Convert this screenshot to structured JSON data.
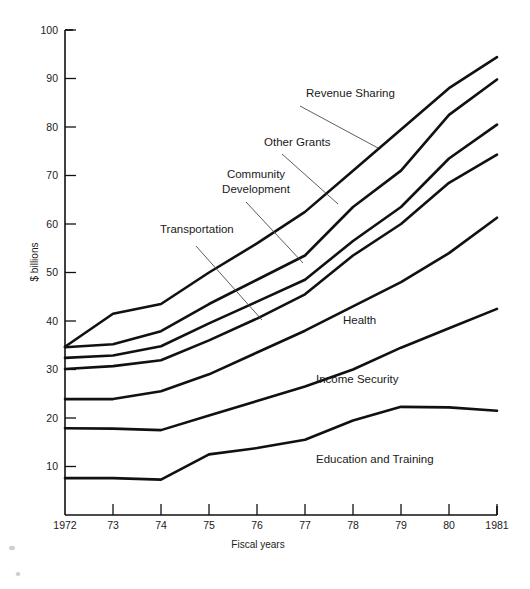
{
  "chart_data": {
    "type": "line",
    "title": "",
    "xlabel": "Fiscal years",
    "ylabel": "$ billions",
    "x": [
      1972,
      1973,
      1974,
      1975,
      1976,
      1977,
      1978,
      1979,
      1980,
      1981
    ],
    "xtick_labels": [
      "1972",
      "73",
      "74",
      "75",
      "76",
      "77",
      "78",
      "79",
      "80",
      "1981"
    ],
    "ytick_labels": [
      "10",
      "20",
      "30",
      "40",
      "50",
      "60",
      "70",
      "80",
      "90",
      "100"
    ],
    "ytick_values": [
      10,
      20,
      30,
      40,
      50,
      60,
      70,
      80,
      90,
      100
    ],
    "ylim": [
      0,
      100
    ],
    "xlim": [
      1972,
      1981
    ],
    "grid": false,
    "legend_position": "inline-annotations",
    "stacking": "cumulative-boundaries",
    "note": "Seven cumulative boundary lines; each labelled band is the gap between adjacent lines.",
    "series": [
      {
        "name": "Revenue Sharing",
        "label": "Revenue Sharing",
        "values": [
          34.7,
          41.5,
          43.5,
          50.0,
          56.0,
          62.5,
          71.0,
          79.5,
          88.0,
          94.4
        ]
      },
      {
        "name": "Other Grants",
        "label": "Other Grants",
        "values": [
          34.6,
          35.2,
          37.9,
          43.5,
          48.5,
          53.5,
          63.5,
          71.0,
          82.5,
          89.8
        ]
      },
      {
        "name": "Community Development",
        "label": "Community Development",
        "values": [
          32.4,
          32.9,
          34.8,
          39.5,
          44.0,
          48.5,
          56.5,
          63.5,
          73.5,
          80.5
        ]
      },
      {
        "name": "Transportation",
        "label": "Transportation",
        "values": [
          30.1,
          30.7,
          31.9,
          36.0,
          40.5,
          45.5,
          53.5,
          60.0,
          68.5,
          74.3
        ]
      },
      {
        "name": "Health",
        "label": "Health",
        "values": [
          23.9,
          23.9,
          25.5,
          29.0,
          33.5,
          38.0,
          43.0,
          48.0,
          54.0,
          61.3
        ]
      },
      {
        "name": "Income Security",
        "label": "Income Security",
        "values": [
          17.9,
          17.8,
          17.5,
          20.5,
          23.5,
          26.5,
          30.0,
          34.5,
          38.5,
          42.5
        ]
      },
      {
        "name": "Education and Training",
        "label": "Education and Training",
        "values": [
          7.6,
          7.6,
          7.3,
          12.5,
          13.8,
          15.5,
          19.5,
          22.3,
          22.2,
          21.5
        ]
      }
    ],
    "annotations": [
      {
        "name": "revenue-sharing",
        "text": "Revenue Sharing",
        "label_x": 306,
        "label_y": 97,
        "leader_from_x": 300,
        "leader_from_y": 106,
        "leader_to_x": 378,
        "leader_to_y": 148
      },
      {
        "name": "other-grants",
        "text": "Other Grants",
        "label_x": 264,
        "label_y": 146,
        "leader_from_x": 282,
        "leader_from_y": 154,
        "leader_to_x": 338,
        "leader_to_y": 204
      },
      {
        "name": "community-development",
        "text": "Community Development",
        "label_x": 208,
        "label_y": 178,
        "leader_from_x": 246,
        "leader_from_y": 202,
        "leader_to_x": 303,
        "leader_to_y": 263
      },
      {
        "name": "transportation",
        "text": "Transportation",
        "label_x": 160,
        "label_y": 233,
        "leader_from_x": 196,
        "leader_from_y": 246,
        "leader_to_x": 262,
        "leader_to_y": 320
      },
      {
        "name": "health",
        "text": "Health",
        "label_x": 343,
        "label_y": 324,
        "leader_from_x": 0,
        "leader_from_y": 0,
        "leader_to_x": 0,
        "leader_to_y": 0
      },
      {
        "name": "income-security",
        "text": "Income Security",
        "label_x": 316,
        "label_y": 383,
        "leader_from_x": 0,
        "leader_from_y": 0,
        "leader_to_x": 0,
        "leader_to_y": 0
      },
      {
        "name": "education-and-training",
        "text": "Education and Training",
        "label_x": 316,
        "label_y": 463,
        "leader_from_x": 0,
        "leader_from_y": 0,
        "leader_to_x": 0,
        "leader_to_y": 0
      }
    ]
  }
}
